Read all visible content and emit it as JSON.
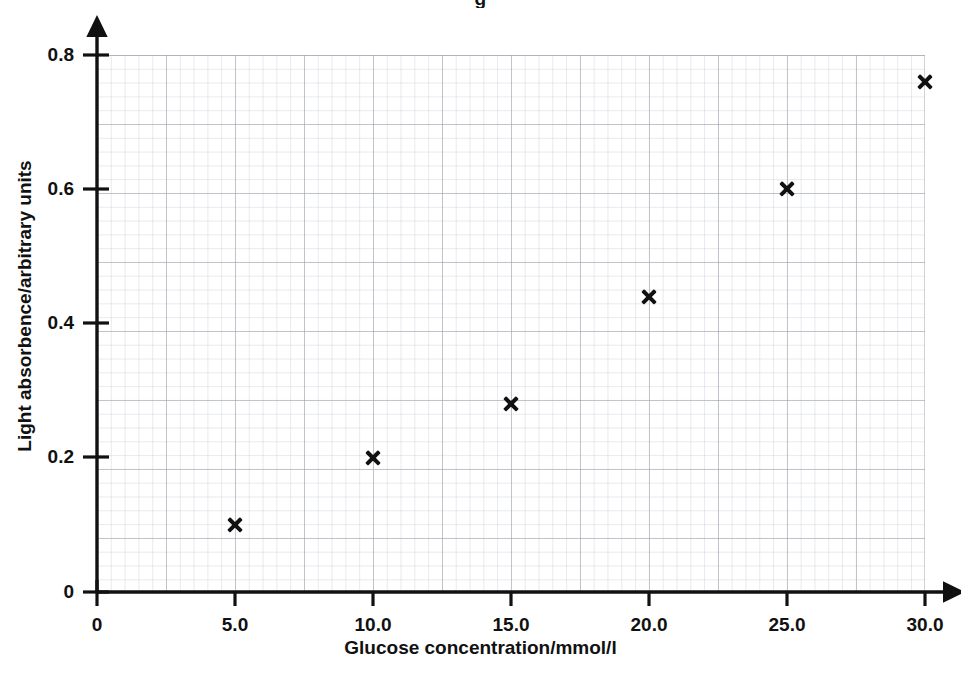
{
  "figure": {
    "title_fragment": "g",
    "background_color": "#ffffff",
    "marker_color": "#111111",
    "axis_color": "#111111",
    "grid_major_color": "#969ca8",
    "grid_minor_color": "#b0b6c2"
  },
  "chart_data": {
    "type": "scatter",
    "title": "",
    "xlabel": "Glucose concentration/mmol/l",
    "ylabel": "Light absorbence/arbitrary units",
    "xlim": [
      0,
      30
    ],
    "ylim": [
      0,
      0.8
    ],
    "grid": true,
    "legend": "none",
    "marker_style": "x",
    "xticks": [
      0,
      5,
      10,
      15,
      20,
      25,
      30
    ],
    "xtick_labels": [
      "0",
      "5.0",
      "10.0",
      "15.0",
      "20.0",
      "25.0",
      "30.0"
    ],
    "yticks": [
      0,
      0.2,
      0.4,
      0.6,
      0.8
    ],
    "ytick_labels": [
      "0",
      "0.2",
      "0.4",
      "0.6",
      "0.8"
    ],
    "x": [
      5.0,
      10.0,
      15.0,
      20.0,
      25.0,
      30.0
    ],
    "y": [
      0.1,
      0.2,
      0.28,
      0.44,
      0.6,
      0.76
    ],
    "points": [
      {
        "x": 5.0,
        "y": 0.1
      },
      {
        "x": 10.0,
        "y": 0.2
      },
      {
        "x": 15.0,
        "y": 0.28
      },
      {
        "x": 20.0,
        "y": 0.44
      },
      {
        "x": 25.0,
        "y": 0.6
      },
      {
        "x": 30.0,
        "y": 0.76
      }
    ]
  },
  "geometry": {
    "origin_x_px": 97,
    "origin_y_px": 592,
    "plot_right_px": 925,
    "plot_top_px": 55,
    "x_axis_arrow_end_px": 950,
    "y_axis_arrow_end_px": 30
  }
}
